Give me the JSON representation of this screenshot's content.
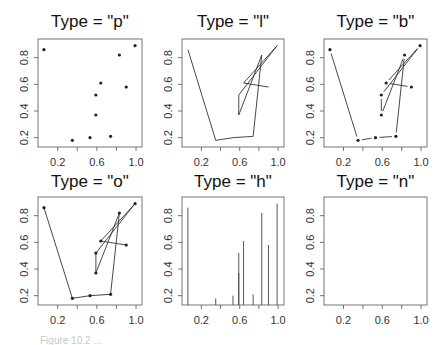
{
  "figure": {
    "caption": "Figure 10.2 ..."
  },
  "chart_data": {
    "type": "scatter",
    "layout": {
      "rows": 2,
      "cols": 3
    },
    "x": [
      0.06,
      0.35,
      0.53,
      0.74,
      0.83,
      0.59,
      0.59,
      0.99,
      0.64,
      0.9
    ],
    "y": [
      0.86,
      0.18,
      0.2,
      0.21,
      0.82,
      0.37,
      0.52,
      0.89,
      0.61,
      0.58
    ],
    "xlim": [
      0.04,
      1.02
    ],
    "ylim": [
      0.16,
      0.91
    ],
    "xticks": [
      0.2,
      0.4,
      0.6,
      0.8,
      1.0
    ],
    "xtick_labels": [
      "0.2",
      "",
      "0.6",
      "",
      "1.0"
    ],
    "yticks": [
      0.2,
      0.4,
      0.6,
      0.8
    ],
    "ytick_labels": [
      "0.2",
      "0.4",
      "0.6",
      "0.8"
    ],
    "xlabel": "",
    "ylabel": "",
    "grid": false,
    "panels": [
      {
        "title": "Type = \"p\"",
        "type": "p"
      },
      {
        "title": "Type = \"l\"",
        "type": "l"
      },
      {
        "title": "Type = \"b\"",
        "type": "b"
      },
      {
        "title": "Type = \"o\"",
        "type": "o"
      },
      {
        "title": "Type = \"h\"",
        "type": "h"
      },
      {
        "title": "Type = \"n\"",
        "type": "n"
      }
    ]
  }
}
